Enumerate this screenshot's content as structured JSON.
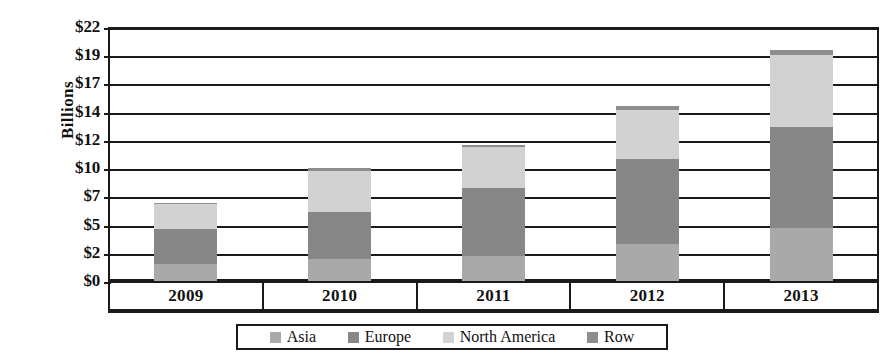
{
  "chart_data": {
    "type": "bar",
    "stacked": true,
    "title": "",
    "xlabel": "",
    "ylabel": "Billions",
    "categories": [
      "2009",
      "2010",
      "2011",
      "2012",
      "2013"
    ],
    "ylim": [
      0,
      22
    ],
    "ytick_values": [
      0,
      2,
      5,
      7,
      10,
      12,
      14,
      17,
      19,
      22
    ],
    "ytick_labels": [
      "$0",
      "$2",
      "$5",
      "$7",
      "$10",
      "$12",
      "$14",
      "$17",
      "$19",
      "$22"
    ],
    "grid": true,
    "legend_position": "bottom",
    "series": [
      {
        "name": "Asia",
        "color": "#a9a9a9",
        "values": [
          1.5,
          1.9,
          2.2,
          3.2,
          4.6
        ]
      },
      {
        "name": "Europe",
        "color": "#878787",
        "values": [
          3.0,
          4.1,
          5.9,
          7.4,
          8.7
        ]
      },
      {
        "name": "North America",
        "color": "#d2d2d2",
        "values": [
          2.2,
          3.5,
          3.5,
          4.2,
          6.3
        ]
      },
      {
        "name": "Row",
        "color": "#8d8d8d",
        "values": [
          0.1,
          0.3,
          0.2,
          0.4,
          0.4
        ]
      }
    ],
    "totals": [
      6.8,
      9.8,
      11.8,
      15.2,
      20.0
    ]
  },
  "legend": {
    "items": [
      {
        "label": "Asia",
        "color": "#a9a9a9"
      },
      {
        "label": "Europe",
        "color": "#878787"
      },
      {
        "label": "North America",
        "color": "#d2d2d2"
      },
      {
        "label": "Row",
        "color": "#8d8d8d"
      }
    ]
  },
  "axis": {
    "y_title": "Billions"
  }
}
